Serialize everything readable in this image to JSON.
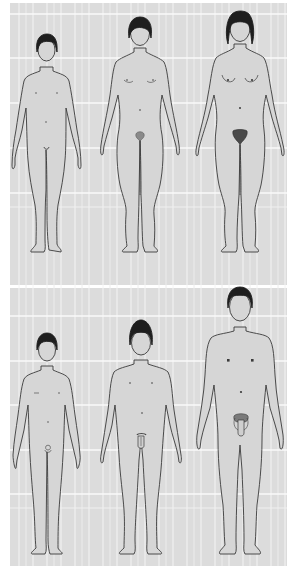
{
  "diagram": {
    "title": "",
    "colors": {
      "page_background": "#ffffff",
      "grid_background": "#dcdcdc",
      "grid_lines": "#f7f7f7",
      "body_fill": "#d6d6d6",
      "outline": "#3a3a3a",
      "hair": "#1e1e1e"
    },
    "rows": [
      {
        "name": "female",
        "figures": [
          {
            "stage": "prepubertal",
            "sex": "female",
            "center_x": 46,
            "head_top_y": 34,
            "feet_y": 252
          },
          {
            "stage": "early-puberty",
            "sex": "female",
            "center_x": 140,
            "head_top_y": 17,
            "feet_y": 252
          },
          {
            "stage": "adult",
            "sex": "female",
            "center_x": 240,
            "head_top_y": 10,
            "feet_y": 252
          }
        ]
      },
      {
        "name": "male",
        "figures": [
          {
            "stage": "prepubertal",
            "sex": "male",
            "center_x": 47,
            "head_top_y": 333,
            "feet_y": 553
          },
          {
            "stage": "early-puberty",
            "sex": "male",
            "center_x": 141,
            "head_top_y": 318,
            "feet_y": 553
          },
          {
            "stage": "adult",
            "sex": "male",
            "center_x": 240,
            "head_top_y": 287,
            "feet_y": 553
          }
        ]
      }
    ],
    "grid": {
      "vertical_lines_x": [
        19,
        33,
        47,
        61,
        75,
        89,
        103,
        117,
        131,
        145,
        159,
        173,
        187,
        201,
        215,
        229,
        243,
        257,
        271,
        285
      ],
      "top_panel_horizontal_y": [
        14,
        58,
        103,
        148,
        193
      ],
      "bottom_panel_horizontal_y": [
        316,
        361,
        405,
        450,
        494
      ]
    }
  }
}
